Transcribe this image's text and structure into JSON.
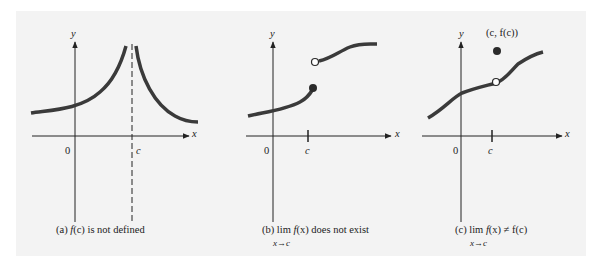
{
  "figure": {
    "panels": [
      {
        "id": "a",
        "axis_x_label": "x",
        "axis_y_label": "y",
        "origin_label": "0",
        "c_label": "c",
        "caption_prefix": "(a) ",
        "caption_f": "f",
        "caption_arg": "(c)",
        "caption_rest": " is not defined",
        "features": [
          "vertical asymptote at x=c (dashed line)",
          "curve increases to +infinity from left",
          "curve decreases from +infinity on right"
        ]
      },
      {
        "id": "b",
        "axis_x_label": "x",
        "axis_y_label": "y",
        "origin_label": "0",
        "c_label": "c",
        "caption_prefix": "(b) lim ",
        "caption_f": "f",
        "caption_arg": "(x)",
        "caption_rest": " does not exist",
        "caption_sub": "x→c",
        "features": [
          "jump discontinuity at x=c",
          "filled dot at end of left piece",
          "open circle at start of right piece"
        ]
      },
      {
        "id": "c",
        "axis_x_label": "x",
        "axis_y_label": "y",
        "origin_label": "0",
        "c_label": "c",
        "point_label": "(c, f(c))",
        "caption_prefix": "(c) lim ",
        "caption_f": "f",
        "caption_arg": "(x)",
        "caption_rest": " ≠ f(c)",
        "caption_sub": "x→c",
        "features": [
          "removable discontinuity at x=c",
          "open circle on curve",
          "filled dot above curve at (c, f(c))"
        ]
      }
    ],
    "colors": {
      "background": "#f3f3f3",
      "curve": "#3a3a3a",
      "axis": "#222222"
    }
  }
}
